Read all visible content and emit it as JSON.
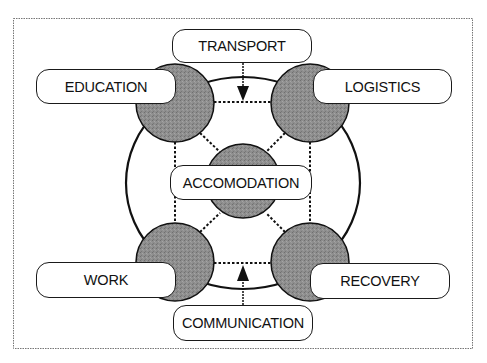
{
  "diagram": {
    "type": "hub-and-spoke concept diagram",
    "center": {
      "label": "ACCOMODATION"
    },
    "nodes": [
      {
        "id": "education",
        "label": "EDUCATION",
        "position": "top-left"
      },
      {
        "id": "logistics",
        "label": "LOGISTICS",
        "position": "top-right"
      },
      {
        "id": "work",
        "label": "WORK",
        "position": "bottom-left"
      },
      {
        "id": "recovery",
        "label": "RECOVERY",
        "position": "bottom-right"
      }
    ],
    "inputs": [
      {
        "id": "transport",
        "label": "TRANSPORT",
        "position": "top",
        "arrow": "down"
      },
      {
        "id": "communication",
        "label": "COMMUNICATION",
        "position": "bottom",
        "arrow": "up"
      }
    ],
    "colors": {
      "circle_fill": "#8c8c8c",
      "stroke": "#1a1a1a",
      "background": "#ffffff",
      "frame": "#777777"
    }
  }
}
